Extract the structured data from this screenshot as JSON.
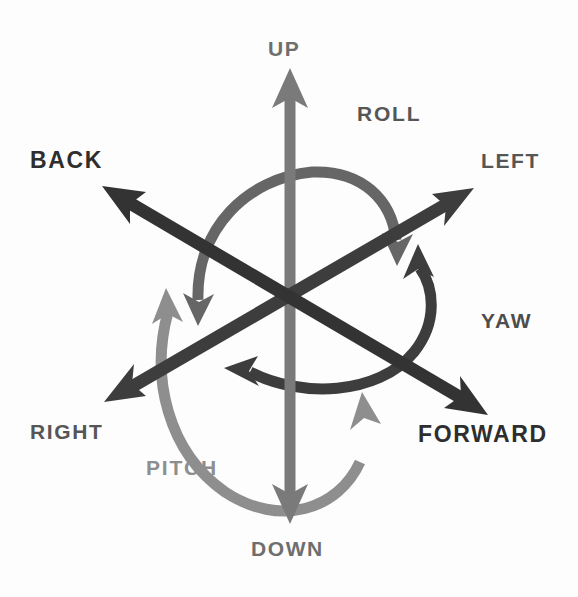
{
  "diagram": {
    "background_color": "#fdfdfd",
    "center": {
      "x": 290,
      "y": 295
    },
    "translation_axes": [
      {
        "id": "up-down",
        "name": "vertical-axis",
        "positive_label": "UP",
        "negative_label": "DOWN",
        "color": "#7a7a7a",
        "label_color": "#6e6e6e",
        "stroke_width": 11,
        "tip_positive": {
          "x": 290,
          "y": 72
        },
        "tip_negative": {
          "x": 290,
          "y": 518
        }
      },
      {
        "id": "back-forward",
        "name": "longitudinal-axis",
        "positive_label": "FORWARD",
        "negative_label": "BACK",
        "color": "#333333",
        "label_color": "#2e2e2e",
        "stroke_width": 13,
        "tip_positive": {
          "x": 485,
          "y": 412
        },
        "tip_negative": {
          "x": 105,
          "y": 188
        }
      },
      {
        "id": "right-left",
        "name": "lateral-axis",
        "positive_label": "LEFT",
        "negative_label": "RIGHT",
        "color": "#3d3d3d",
        "label_color": "#565656",
        "stroke_width": 13,
        "tip_positive": {
          "x": 470,
          "y": 190
        },
        "tip_negative": {
          "x": 108,
          "y": 400
        }
      }
    ],
    "rotation_arcs": [
      {
        "id": "roll",
        "label": "ROLL",
        "about_axis": "back-forward",
        "color": "#666666",
        "label_color": "#565656",
        "stroke_width": 11,
        "arrow_heads": 2,
        "description": "arc over the top of the vertical axis, heads at lower-left and lower-right"
      },
      {
        "id": "yaw",
        "label": "YAW",
        "about_axis": "up-down",
        "color": "#3d3d3d",
        "label_color": "#4d4d4d",
        "stroke_width": 11,
        "arrow_heads": 2,
        "description": "arc sweeping around the right side, heads at upper-right and left"
      },
      {
        "id": "pitch",
        "label": "PITCH",
        "about_axis": "right-left",
        "color": "#8e8e8e",
        "label_color": "#8e8e8e",
        "stroke_width": 11,
        "arrow_heads": 2,
        "description": "arc sweeping around the lower-left, heads pointing up at left and up at lower-right"
      }
    ],
    "labels": {
      "up": "UP",
      "down": "DOWN",
      "back": "BACK",
      "forward": "FORWARD",
      "left": "LEFT",
      "right": "RIGHT",
      "roll": "ROLL",
      "yaw": "YAW",
      "pitch": "PITCH"
    }
  }
}
